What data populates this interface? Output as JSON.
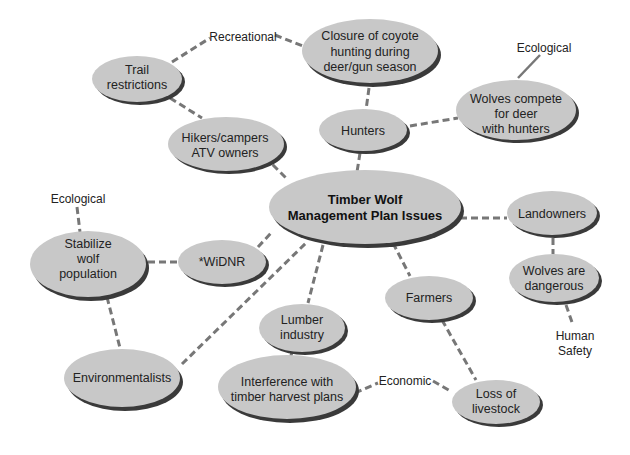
{
  "diagram": {
    "title": "Timber Wolf Management Plan Issues",
    "center": {
      "id": "center",
      "lines": [
        "Timber Wolf",
        "Management Plan Issues"
      ]
    },
    "nodes": [
      {
        "id": "trail",
        "lines": [
          "Trail",
          "restrictions"
        ]
      },
      {
        "id": "closure",
        "lines": [
          "Closure of coyote",
          "hunting during",
          "deer/gun season"
        ]
      },
      {
        "id": "hikers",
        "lines": [
          "Hikers/campers",
          "ATV owners"
        ]
      },
      {
        "id": "hunters",
        "lines": [
          "Hunters"
        ]
      },
      {
        "id": "compete",
        "lines": [
          "Wolves compete",
          "for deer",
          "with hunters"
        ]
      },
      {
        "id": "landowners",
        "lines": [
          "Landowners"
        ]
      },
      {
        "id": "stabilize",
        "lines": [
          "Stabilize",
          "wolf",
          "population"
        ]
      },
      {
        "id": "widnr",
        "lines": [
          "*WiDNR"
        ]
      },
      {
        "id": "dangerous",
        "lines": [
          "Wolves are",
          "dangerous"
        ]
      },
      {
        "id": "farmers",
        "lines": [
          "Farmers"
        ]
      },
      {
        "id": "lumber",
        "lines": [
          "Lumber",
          "industry"
        ]
      },
      {
        "id": "environmentalists",
        "lines": [
          "Environmentalists"
        ]
      },
      {
        "id": "interference",
        "lines": [
          "Interference with",
          "timber harvest plans"
        ]
      },
      {
        "id": "livestock",
        "lines": [
          "Loss of",
          "livestock"
        ]
      }
    ],
    "categories": {
      "recreational": "Recreational",
      "ecological_top": "Ecological",
      "ecological_left": "Ecological",
      "economic": "Economic",
      "human_safety": [
        "Human",
        "Safety"
      ]
    },
    "edges": [
      [
        "trail",
        "recreational"
      ],
      [
        "recreational",
        "closure"
      ],
      [
        "trail",
        "hikers"
      ],
      [
        "hikers",
        "center"
      ],
      [
        "closure",
        "hunters"
      ],
      [
        "hunters",
        "center"
      ],
      [
        "hunters",
        "compete"
      ],
      [
        "compete",
        "ecological_top"
      ],
      [
        "center",
        "landowners"
      ],
      [
        "landowners",
        "dangerous"
      ],
      [
        "dangerous",
        "human_safety"
      ],
      [
        "ecological_left",
        "stabilize"
      ],
      [
        "stabilize",
        "widnr"
      ],
      [
        "widnr",
        "center"
      ],
      [
        "stabilize",
        "environmentalists"
      ],
      [
        "environmentalists",
        "center"
      ],
      [
        "center",
        "lumber"
      ],
      [
        "lumber",
        "interference"
      ],
      [
        "center",
        "farmers"
      ],
      [
        "farmers",
        "livestock"
      ],
      [
        "interference",
        "economic"
      ],
      [
        "economic",
        "livestock"
      ]
    ]
  }
}
